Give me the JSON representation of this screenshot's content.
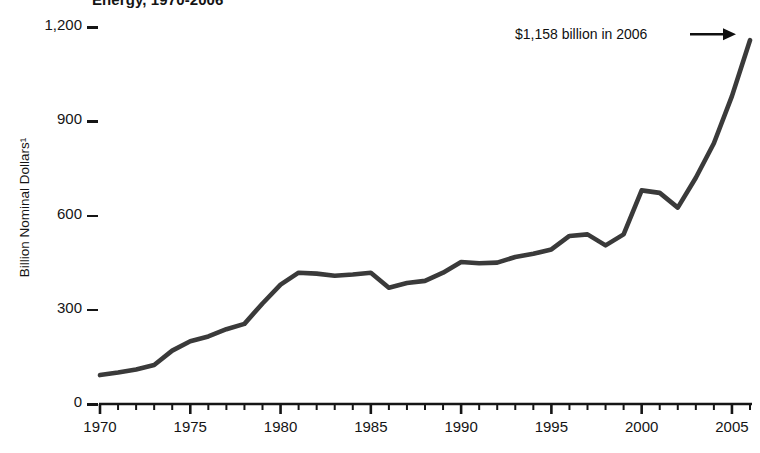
{
  "title": "Energy, 1970-2006",
  "annotation": {
    "text": "$1,158 billion in 2006",
    "arrow_glyph": "→"
  },
  "axes": {
    "y": {
      "label": "Billion Nominal Dollars¹",
      "ticks": [
        "0",
        "300",
        "600",
        "900",
        "1,200"
      ],
      "min": 0,
      "max": 1200
    },
    "x": {
      "label": "",
      "ticks": [
        "1970",
        "1975",
        "1980",
        "1985",
        "1990",
        "1995",
        "2000",
        "2005"
      ],
      "min": 1970,
      "max": 2006
    }
  },
  "style": {
    "line_color": "#3a3a3a",
    "axis_color": "#151515",
    "background": "#ffffff",
    "line_width": 4.6
  },
  "chart_data": {
    "type": "line",
    "title": "Energy, 1970-2006",
    "xlabel": "",
    "ylabel": "Billion Nominal Dollars¹",
    "xlim": [
      1970,
      2006
    ],
    "ylim": [
      0,
      1200
    ],
    "grid": false,
    "legend": null,
    "annotations": [
      {
        "text": "$1,158 billion in 2006",
        "x": 2006,
        "y": 1158
      }
    ],
    "x": [
      1970,
      1971,
      1972,
      1973,
      1974,
      1975,
      1976,
      1977,
      1978,
      1979,
      1980,
      1981,
      1982,
      1983,
      1984,
      1985,
      1986,
      1987,
      1988,
      1989,
      1990,
      1991,
      1992,
      1993,
      1994,
      1995,
      1996,
      1997,
      1998,
      1999,
      2000,
      2001,
      2002,
      2003,
      2004,
      2005,
      2006
    ],
    "values": [
      92,
      100,
      110,
      124,
      170,
      200,
      215,
      238,
      255,
      320,
      380,
      418,
      415,
      408,
      412,
      418,
      370,
      385,
      392,
      418,
      452,
      448,
      450,
      468,
      478,
      492,
      535,
      540,
      505,
      540,
      680,
      672,
      625,
      720,
      830,
      980,
      1158
    ],
    "series": [
      {
        "name": "Energy expenditures",
        "values": [
          92,
          100,
          110,
          124,
          170,
          200,
          215,
          238,
          255,
          320,
          380,
          418,
          415,
          408,
          412,
          418,
          370,
          385,
          392,
          418,
          452,
          448,
          450,
          468,
          478,
          492,
          535,
          540,
          505,
          540,
          680,
          672,
          625,
          720,
          830,
          980,
          1158
        ]
      }
    ]
  }
}
